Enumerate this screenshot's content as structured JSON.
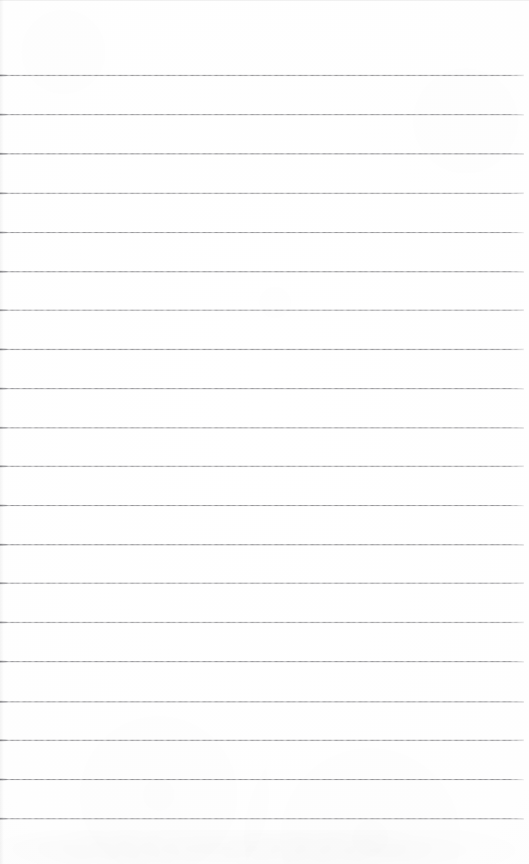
{
  "document": {
    "kind": "scanned-lined-paper",
    "title": "Blank Ruled Notebook Page",
    "content_text": "",
    "page_width": 529,
    "page_height": 864,
    "background_color": "#fdfdfd",
    "has_handwriting": false,
    "has_printed_text": false,
    "has_vertical_margin_rule": false
  },
  "ruling": {
    "line_count": 20,
    "line_color": "#8c8c90",
    "line_thickness_px": 1,
    "spacing_px": 39.1,
    "first_line_y": 75,
    "last_line_y": 818,
    "line_start_x": 0,
    "line_end_x": 524,
    "top_margin_px": 75,
    "bottom_margin_px": 46,
    "right_margin_px": 5,
    "lines": [
      {
        "index": 1,
        "y": 75,
        "x1": 0,
        "x2": 524
      },
      {
        "index": 2,
        "y": 114,
        "x1": 0,
        "x2": 524
      },
      {
        "index": 3,
        "y": 153,
        "x1": 0,
        "x2": 524
      },
      {
        "index": 4,
        "y": 193,
        "x1": 0,
        "x2": 524
      },
      {
        "index": 5,
        "y": 232,
        "x1": 0,
        "x2": 524
      },
      {
        "index": 6,
        "y": 271,
        "x1": 0,
        "x2": 524
      },
      {
        "index": 7,
        "y": 310,
        "x1": 0,
        "x2": 524
      },
      {
        "index": 8,
        "y": 349,
        "x1": 0,
        "x2": 524
      },
      {
        "index": 9,
        "y": 388,
        "x1": 0,
        "x2": 524
      },
      {
        "index": 10,
        "y": 427,
        "x1": 0,
        "x2": 524
      },
      {
        "index": 11,
        "y": 466,
        "x1": 0,
        "x2": 524
      },
      {
        "index": 12,
        "y": 505,
        "x1": 0,
        "x2": 524
      },
      {
        "index": 13,
        "y": 544,
        "x1": 0,
        "x2": 524
      },
      {
        "index": 14,
        "y": 583,
        "x1": 0,
        "x2": 524
      },
      {
        "index": 15,
        "y": 622,
        "x1": 0,
        "x2": 524
      },
      {
        "index": 16,
        "y": 661,
        "x1": 0,
        "x2": 524
      },
      {
        "index": 17,
        "y": 701,
        "x1": 0,
        "x2": 524
      },
      {
        "index": 18,
        "y": 740,
        "x1": 0,
        "x2": 524
      },
      {
        "index": 19,
        "y": 779,
        "x1": 0,
        "x2": 524
      },
      {
        "index": 20,
        "y": 818,
        "x1": 0,
        "x2": 524
      }
    ]
  },
  "scan_artifacts": {
    "top_edge_visible": true,
    "left_edge_shadow_visible": true,
    "bottom_smudge_visible": true,
    "bottom_smudge_top_y": 830
  }
}
